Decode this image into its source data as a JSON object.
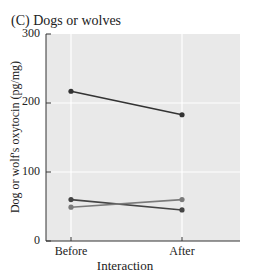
{
  "panel": {
    "title": "(C) Dogs or wolves"
  },
  "chart_data": {
    "type": "line",
    "title": "(C) Dogs or wolves",
    "xlabel": "Interaction",
    "ylabel": "Dog or wolf's oxytocin (pg/mg)",
    "categories": [
      "Before",
      "After"
    ],
    "ylim": [
      0,
      300
    ],
    "yticks": [
      0,
      100,
      200,
      300
    ],
    "grid": true,
    "series": [
      {
        "name": "Individual 1",
        "values": [
          217,
          183
        ],
        "color": "#333333"
      },
      {
        "name": "Individual 2",
        "values": [
          60,
          45
        ],
        "color": "#444444"
      },
      {
        "name": "Individual 3",
        "values": [
          49,
          60
        ],
        "color": "#7a7a7a"
      }
    ],
    "colors": {
      "plot_background": "#e9e9e9",
      "gridline": "#ffffff",
      "axis": "#333333"
    }
  },
  "axis": {
    "y_ticks": [
      "300",
      "200",
      "100",
      "0"
    ],
    "x_ticks": [
      "Before",
      "After"
    ],
    "x_label": "Interaction",
    "y_label": "Dog or wolf's oxytocin (pg/mg)"
  }
}
